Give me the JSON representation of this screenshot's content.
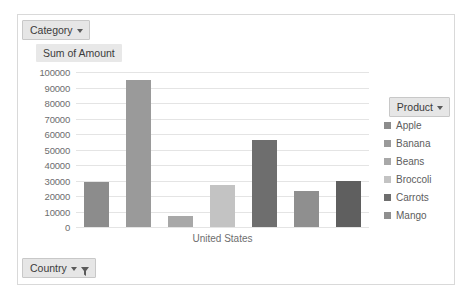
{
  "chart_data": {
    "type": "bar",
    "title": "Sum of Amount",
    "xlabel": "United States",
    "ylabel": "",
    "categories": [
      "Apple",
      "Banana",
      "Beans",
      "Broccoli",
      "Carrots",
      "Mango"
    ],
    "values": [
      29000,
      95000,
      7000,
      27000,
      56000,
      23000
    ],
    "series": [
      {
        "name": "Sum of Amount",
        "values": [
          29000,
          95000,
          7000,
          27000,
          56000,
          23000
        ]
      }
    ],
    "colors": [
      "#8c8c8c",
      "#9a9a9a",
      "#a8a8a8",
      "#c3c3c3",
      "#6e6e6e",
      "#8f8f8f"
    ],
    "ylim": [
      0,
      100000
    ],
    "yticks": [
      100000,
      90000,
      80000,
      70000,
      60000,
      50000,
      40000,
      30000,
      20000,
      10000,
      0
    ],
    "ytick_labels": [
      "100000",
      "90000",
      "80000",
      "70000",
      "60000",
      "50000",
      "40000",
      "30000",
      "20000",
      "10000",
      "0"
    ],
    "grid": true,
    "legend_position": "right",
    "legend_title": "Product"
  },
  "extra_bar": {
    "value": 30000,
    "color": "#5f5f5f"
  },
  "field_buttons": {
    "category": {
      "label": "Category",
      "caret": "chevron-down-icon"
    },
    "country": {
      "label": "Country",
      "caret": "chevron-down-icon",
      "filter": "filter-funnel-icon"
    },
    "product": {
      "label": "Product",
      "caret": "chevron-down-icon"
    }
  },
  "legend": {
    "title": "Product",
    "items": [
      {
        "label": "Apple",
        "color": "#8c8c8c"
      },
      {
        "label": "Banana",
        "color": "#9a9a9a"
      },
      {
        "label": "Beans",
        "color": "#a8a8a8"
      },
      {
        "label": "Broccoli",
        "color": "#c3c3c3"
      },
      {
        "label": "Carrots",
        "color": "#6e6e6e"
      },
      {
        "label": "Mango",
        "color": "#8f8f8f"
      }
    ]
  }
}
